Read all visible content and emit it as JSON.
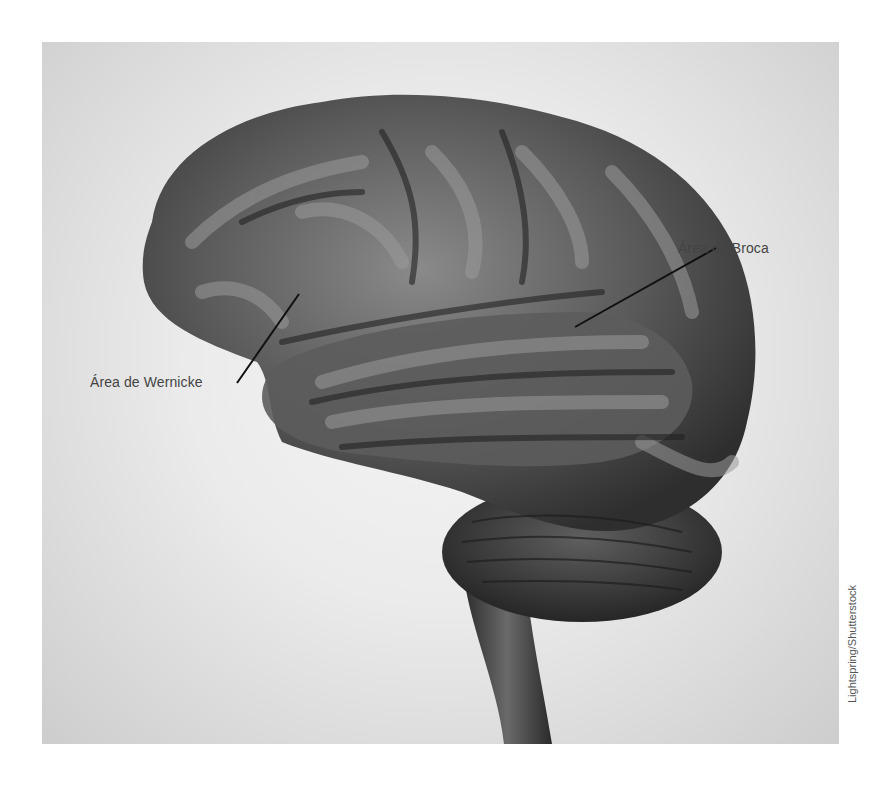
{
  "figure": {
    "labels": {
      "broca": "Área de Broca",
      "wernicke": "Área de Wernicke"
    },
    "credit": "Lightspring/Shutterstock"
  }
}
